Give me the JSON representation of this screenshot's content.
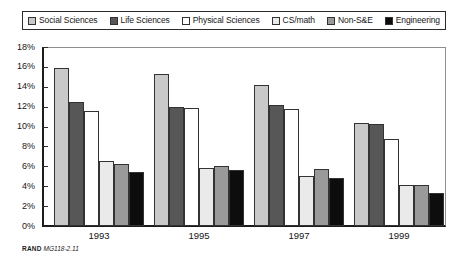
{
  "legend": {
    "position": "top",
    "boxed": true,
    "entries": [
      {
        "label": "Social Sciences",
        "color": "#c9c9c9",
        "name": "legend-social-sciences"
      },
      {
        "label": "Life Sciences",
        "color": "#575757",
        "name": "legend-life-sciences"
      },
      {
        "label": "Physical Sciences",
        "color": "#ffffff",
        "name": "legend-physical-sciences"
      },
      {
        "label": "CS/math",
        "color": "#eaeaea",
        "name": "legend-cs-math"
      },
      {
        "label": "Non-S&E",
        "color": "#9a9a9a",
        "name": "legend-non-se"
      },
      {
        "label": "Engineering",
        "color": "#0d0d0d",
        "name": "legend-engineering"
      }
    ]
  },
  "axis": {
    "y_ticks": [
      "18%",
      "16%",
      "14%",
      "12%",
      "10%",
      "8%",
      "6%",
      "4%",
      "2%",
      "0%"
    ],
    "x_ticks": [
      "1993",
      "1995",
      "1997",
      "1999"
    ]
  },
  "footer": {
    "brand": "RAND",
    "code": "MG118-2.11"
  },
  "chart_data": {
    "type": "bar",
    "title": "",
    "subtitle": "",
    "xlabel": "",
    "ylabel": "",
    "ylim": [
      0,
      18
    ],
    "ytick_step": 2,
    "ytick_suffix": "%",
    "grid": false,
    "legend_position": "top",
    "categories": [
      "1993",
      "1995",
      "1997",
      "1999"
    ],
    "series": [
      {
        "name": "Social Sciences",
        "color": "#c9c9c9",
        "values": [
          15.9,
          15.3,
          14.2,
          10.4
        ]
      },
      {
        "name": "Life Sciences",
        "color": "#575757",
        "values": [
          12.5,
          12.0,
          12.2,
          10.3
        ]
      },
      {
        "name": "Physical Sciences",
        "color": "#ffffff",
        "values": [
          11.6,
          11.9,
          11.8,
          8.7
        ]
      },
      {
        "name": "CS/math",
        "color": "#eaeaea",
        "values": [
          6.5,
          5.8,
          5.0,
          4.1
        ]
      },
      {
        "name": "Non-S&E",
        "color": "#9a9a9a",
        "values": [
          6.2,
          6.0,
          5.7,
          4.1
        ]
      },
      {
        "name": "Engineering",
        "color": "#0d0d0d",
        "values": [
          5.4,
          5.6,
          4.8,
          3.3
        ]
      }
    ]
  }
}
